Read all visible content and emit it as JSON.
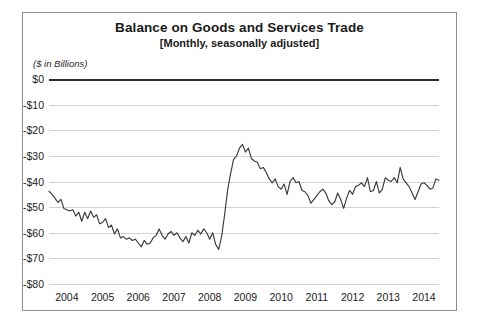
{
  "figure": {
    "title": "Balance on Goods and Services Trade",
    "subtitle": "[Monthly, seasonally adjusted]",
    "units_label": "($ in Billions)"
  },
  "colors": {
    "line": "#3a3a3a",
    "zero_axis": "#2e2e2e",
    "gridline": "#d2d2d2",
    "border": "#8d8d8d",
    "text": "#222222"
  },
  "chart_data": {
    "type": "line",
    "title": "Balance on Goods and Services Trade",
    "subtitle": "[Monthly, seasonally adjusted]",
    "xlabel": "",
    "ylabel": "($ in Billions)",
    "ylim": [
      -80,
      0
    ],
    "xlim": [
      2004.0,
      2014.92
    ],
    "grid": true,
    "legend": false,
    "ytick_labels": [
      "$0",
      "-$10",
      "-$20",
      "-$30",
      "-$40",
      "-$50",
      "-$60",
      "-$70",
      "-$80"
    ],
    "ytick_values": [
      0,
      -10,
      -20,
      -30,
      -40,
      -50,
      -60,
      -70,
      -80
    ],
    "xtick_labels": [
      "2004",
      "2005",
      "2006",
      "2007",
      "2008",
      "2009",
      "2010",
      "2011",
      "2012",
      "2013",
      "2014"
    ],
    "xtick_values": [
      2004,
      2005,
      2006,
      2007,
      2008,
      2009,
      2010,
      2011,
      2012,
      2013,
      2014
    ],
    "series": [
      {
        "name": "Balance on goods and services trade",
        "x_start": 2004.0,
        "x_step": 0.0833333,
        "values": [
          -43.8,
          -45.0,
          -46.5,
          -48.2,
          -47.0,
          -50.5,
          -51.0,
          -51.5,
          -51.0,
          -53.5,
          -52.0,
          -55.5,
          -52.0,
          -54.5,
          -51.5,
          -54.0,
          -53.0,
          -56.5,
          -56.0,
          -54.5,
          -58.0,
          -57.0,
          -60.5,
          -58.5,
          -62.0,
          -61.5,
          -62.5,
          -62.0,
          -63.0,
          -62.5,
          -64.0,
          -65.5,
          -63.0,
          -64.5,
          -64.0,
          -62.0,
          -61.0,
          -58.5,
          -61.0,
          -62.5,
          -60.5,
          -59.5,
          -61.0,
          -60.0,
          -62.0,
          -63.5,
          -61.5,
          -64.0,
          -60.0,
          -61.0,
          -59.0,
          -60.5,
          -58.5,
          -60.0,
          -62.5,
          -60.0,
          -64.5,
          -66.5,
          -61.5,
          -53.0,
          -43.5,
          -37.0,
          -31.5,
          -30.0,
          -27.0,
          -25.5,
          -28.5,
          -27.0,
          -31.0,
          -32.0,
          -32.5,
          -35.0,
          -34.5,
          -36.5,
          -39.0,
          -40.5,
          -39.0,
          -42.0,
          -43.0,
          -41.0,
          -45.0,
          -40.0,
          -38.5,
          -40.5,
          -40.0,
          -43.5,
          -44.0,
          -45.5,
          -48.5,
          -47.0,
          -45.5,
          -44.0,
          -43.0,
          -44.5,
          -47.5,
          -49.0,
          -48.0,
          -44.5,
          -47.0,
          -50.5,
          -46.5,
          -43.5,
          -45.0,
          -42.0,
          -41.5,
          -40.5,
          -42.0,
          -38.5,
          -44.0,
          -43.5,
          -40.0,
          -44.5,
          -43.0,
          -38.5,
          -39.5,
          -40.0,
          -38.5,
          -40.5,
          -34.5,
          -39.0,
          -40.5,
          -42.0,
          -44.5,
          -47.0,
          -44.0,
          -41.0,
          -40.5,
          -41.5,
          -43.0,
          -42.5,
          -39.0,
          -39.5
        ]
      }
    ]
  }
}
